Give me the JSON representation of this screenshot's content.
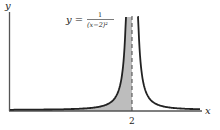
{
  "chart_data": {
    "type": "line",
    "title": "",
    "function": "y = 1/(x-2)^2",
    "equation_label": {
      "lhs": "y =",
      "numerator": "1",
      "denominator": "(x−2)²"
    },
    "xlabel": "x",
    "ylabel": "y",
    "x_ticks": [
      2
    ],
    "x_tick_labels": [
      "2"
    ],
    "asymptote": {
      "x": 2,
      "style": "dashed"
    },
    "shaded_region": {
      "from": "left edge",
      "to": 2,
      "under": "curve",
      "color": "#bdbdbd"
    },
    "curve_color": "#222222",
    "axis_color": "#555555",
    "grid": false,
    "legend": null
  }
}
